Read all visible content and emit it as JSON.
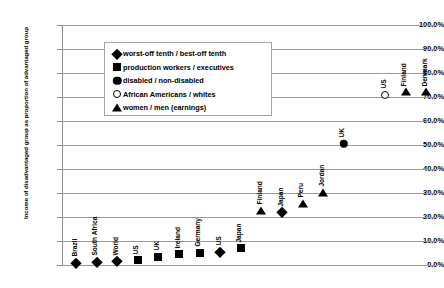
{
  "chart_data": {
    "type": "scatter",
    "title": "",
    "xlabel": "",
    "ylabel": "Income of disadvantaged group as proportion of advantaged group",
    "ylim": [
      0,
      100
    ],
    "ytick_labels": [
      "100.0%",
      "90.0%",
      "80.0%",
      "70.0%",
      "60.0%",
      "50.0%",
      "40.0%",
      "30.0%",
      "20.0%",
      "10.0%",
      "0.0%"
    ],
    "ytick_values": [
      100,
      90,
      80,
      70,
      60,
      50,
      40,
      30,
      20,
      10,
      0
    ],
    "grid": true,
    "legend_position": "top-center",
    "series": [
      {
        "name": "worst-off tenth / best-off tenth",
        "marker": "diamond",
        "points": [
          {
            "label": "Brazil",
            "x": 1,
            "y": 1.0
          },
          {
            "label": "South Africa",
            "x": 2,
            "y": 1.3
          },
          {
            "label": "World",
            "x": 3,
            "y": 1.5
          },
          {
            "label": "US",
            "x": 8,
            "y": 5.5
          },
          {
            "label": "Japan",
            "x": 11,
            "y": 22.0
          }
        ]
      },
      {
        "name": "production workers / executives",
        "marker": "square",
        "points": [
          {
            "label": "US",
            "x": 4,
            "y": 2.0
          },
          {
            "label": "UK",
            "x": 5,
            "y": 3.5
          },
          {
            "label": "Ireland",
            "x": 6,
            "y": 4.5
          },
          {
            "label": "Germany",
            "x": 7,
            "y": 5.2
          },
          {
            "label": "Japan",
            "x": 9,
            "y": 7.0
          }
        ]
      },
      {
        "name": "disabled / non-disabled",
        "marker": "circle",
        "points": [
          {
            "label": "UK",
            "x": 14,
            "y": 50.5
          }
        ]
      },
      {
        "name": "African Americans / whites",
        "marker": "open-circle",
        "points": [
          {
            "label": "US",
            "x": 16,
            "y": 71.0
          }
        ]
      },
      {
        "name": "women / men (earnings)",
        "marker": "triangle",
        "points": [
          {
            "label": "Finland",
            "x": 10,
            "y": 22.5
          },
          {
            "label": "Peru",
            "x": 12,
            "y": 25.5
          },
          {
            "label": "Jordan",
            "x": 13,
            "y": 30.0
          },
          {
            "label": "Finland",
            "x": 17,
            "y": 72.0
          },
          {
            "label": "Denmark",
            "x": 18,
            "y": 72.0
          }
        ]
      }
    ]
  },
  "legend": {
    "items": [
      {
        "symbol": "diamond",
        "label": "worst-off tenth / best-off tenth"
      },
      {
        "symbol": "square",
        "label": "production workers / executives"
      },
      {
        "symbol": "circle",
        "label": "disabled / non-disabled"
      },
      {
        "symbol": "open-circle",
        "label": "African Americans / whites"
      },
      {
        "symbol": "triangle",
        "label": "women / men (earnings)"
      }
    ]
  },
  "axis": {
    "y_title": "Income of disadvantaged group as proportion of advantaged group"
  }
}
